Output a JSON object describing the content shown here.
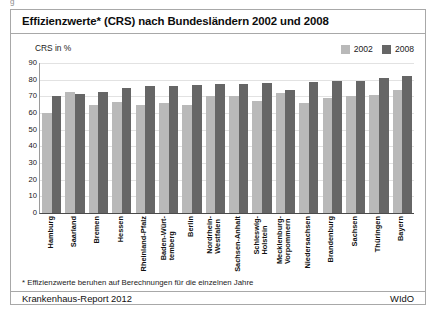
{
  "clipped_top_text": "g",
  "header": {
    "title": "Effizienzwerte* (CRS) nach Bundesländern 2002 und 2008"
  },
  "axis_caption": "CRS in %",
  "legend": {
    "items": [
      {
        "label": "2002",
        "color": "#b9b9b9"
      },
      {
        "label": "2008",
        "color": "#666666"
      }
    ]
  },
  "footnote": "* Effizienzwerte beruhen auf Berechnungen für die einzelnen Jahre",
  "footer": {
    "left": "Krankenhaus-Report 2012",
    "right": "WIdO"
  },
  "colors": {
    "series_2002": "#b9b9b9",
    "series_2008": "#666666",
    "frame": "#a8a8a8",
    "grid": "#e2e2e2",
    "axis": "#4a4a4a"
  },
  "chart_data": {
    "type": "bar",
    "title": "Effizienzwerte* (CRS) nach Bundesländern 2002 und 2008",
    "xlabel": "",
    "ylabel": "CRS in %",
    "ylim": [
      0,
      90
    ],
    "yticks": [
      0,
      10,
      20,
      30,
      40,
      50,
      60,
      70,
      80,
      90
    ],
    "grid": true,
    "legend_position": "top-right",
    "categories": [
      "Hamburg",
      "Saarland",
      "Bremen",
      "Hessen",
      "Rheinland-Pfalz",
      "Baden-Württemberg",
      "Berlin",
      "Nordrhein-Westfalen",
      "Sachsen-Anhalt",
      "Schleswig-Holstein",
      "Mecklenburg-Vorpommern",
      "Niedersachsen",
      "Brandenburg",
      "Sachsen",
      "Thüringen",
      "Bayern"
    ],
    "categories_wrapped": [
      [
        "Hamburg"
      ],
      [
        "Saarland"
      ],
      [
        "Bremen"
      ],
      [
        "Hessen"
      ],
      [
        "Rheinland-Pfalz"
      ],
      [
        "Baden-Würt-",
        "temberg"
      ],
      [
        "Berlin"
      ],
      [
        "Nordrhein-",
        "Westfalen"
      ],
      [
        "Sachsen-Anhalt"
      ],
      [
        "Schleswig-",
        "Holstein"
      ],
      [
        "Mecklenburg-",
        "Vorpommern"
      ],
      [
        "Niedersachsen"
      ],
      [
        "Brandenburg"
      ],
      [
        "Sachsen"
      ],
      [
        "Thüringen"
      ],
      [
        "Bayern"
      ]
    ],
    "series": [
      {
        "name": "2002",
        "color": "#b9b9b9",
        "values": [
          60,
          72.5,
          65,
          66.5,
          65,
          66,
          65,
          70,
          70,
          67,
          72,
          66,
          69,
          70,
          71,
          74
        ]
      },
      {
        "name": "2008",
        "color": "#666666",
        "values": [
          70,
          71.5,
          72.5,
          75,
          76,
          76,
          77,
          77.5,
          77.5,
          78,
          74,
          78.5,
          79,
          79.5,
          81,
          82
        ]
      }
    ]
  }
}
